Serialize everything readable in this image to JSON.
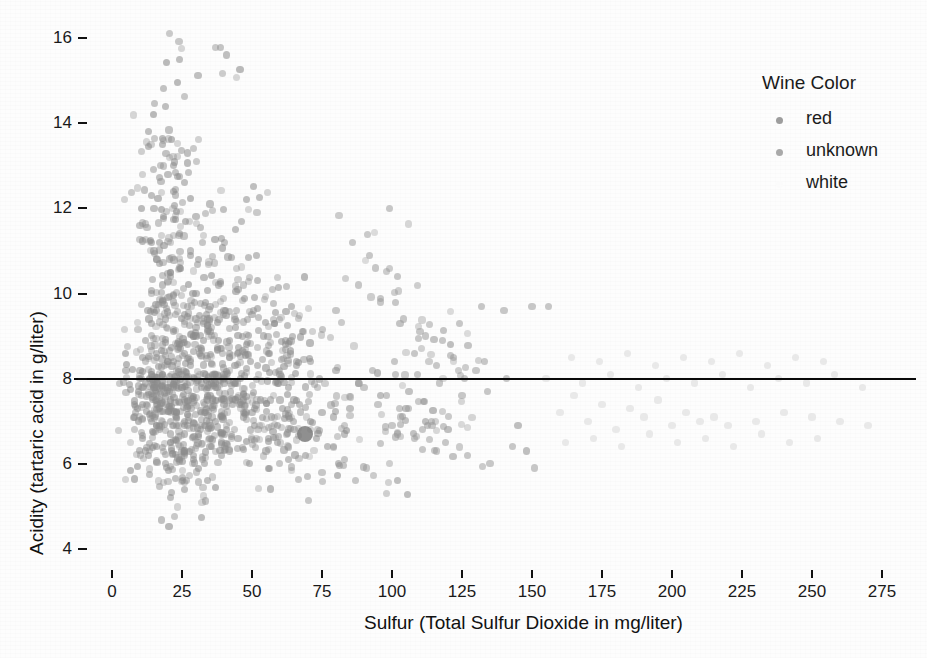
{
  "chart_data": {
    "type": "scatter",
    "title": "",
    "xlabel": "Sulfur (Total Sulfur Dioxide  in mg/liter)",
    "ylabel": "Acidity (tartaric acid in g/liter)",
    "xlim": [
      -4,
      287
    ],
    "ylim": [
      3.4,
      16.4
    ],
    "xticks": [
      0,
      25,
      50,
      75,
      100,
      125,
      150,
      175,
      200,
      225,
      250,
      275
    ],
    "xtick_labels": [
      "0",
      "25",
      "50",
      "75",
      "100",
      "125",
      "150",
      "175",
      "200",
      "225",
      "250",
      "275"
    ],
    "yticks": [
      4,
      6,
      8,
      10,
      12,
      14,
      16
    ],
    "ytick_labels": [
      "4",
      "6",
      "8",
      "10",
      "12",
      "14",
      "16"
    ],
    "grid": false,
    "legend_position": "right",
    "point_color": "#8c8c8c",
    "point_opacity": 0.55,
    "point_radius": 3.6,
    "reference_line": {
      "orientation": "horizontal",
      "y": 8,
      "color": "#0a0a0a",
      "width": 2,
      "x_start": 0,
      "x_end": 287
    },
    "highlight_point": {
      "x": 69,
      "y": 6.7,
      "radius": 8,
      "color": "#7b7b7b"
    },
    "series": [
      {
        "name": "red",
        "color": "#8c8c8c",
        "points": [
          [
            11,
            7.4
          ],
          [
            25,
            7.8
          ],
          [
            15,
            7.8
          ],
          [
            17,
            11.2
          ],
          [
            40,
            7.4
          ],
          [
            59,
            7.9
          ],
          [
            21,
            7.3
          ],
          [
            18,
            7.8
          ],
          [
            102,
            6.7
          ],
          [
            65,
            7.5
          ],
          [
            102,
            5.6
          ],
          [
            37,
            7.8
          ],
          [
            121,
            8.8
          ],
          [
            40,
            7.5
          ],
          [
            59,
            6.9
          ],
          [
            21,
            7.9
          ],
          [
            18,
            8.1
          ],
          [
            47,
            7.5
          ],
          [
            145,
            6.9
          ],
          [
            148,
            6.3
          ],
          [
            63,
            7.8
          ],
          [
            44,
            7.5
          ],
          [
            33,
            6.9
          ],
          [
            34,
            7.8
          ],
          [
            40,
            8.1
          ],
          [
            37,
            7.9
          ],
          [
            42,
            7.5
          ],
          [
            16,
            6.9
          ],
          [
            15,
            7.8
          ],
          [
            18,
            8.1
          ],
          [
            8,
            7.4
          ],
          [
            16,
            7.8
          ],
          [
            23,
            7.8
          ],
          [
            14,
            11.2
          ],
          [
            16,
            7.4
          ],
          [
            40,
            7.9
          ],
          [
            51,
            7.3
          ],
          [
            20,
            7.8
          ],
          [
            26,
            6.7
          ],
          [
            34,
            7.5
          ],
          [
            34,
            5.6
          ],
          [
            19,
            7.8
          ],
          [
            27,
            8.8
          ],
          [
            26,
            7.5
          ],
          [
            23,
            6.9
          ],
          [
            12,
            7.9
          ],
          [
            14,
            8.1
          ],
          [
            16,
            7.5
          ],
          [
            16,
            6.9
          ],
          [
            12,
            6.3
          ],
          [
            22,
            7.8
          ],
          [
            21,
            7.5
          ],
          [
            26,
            6.9
          ],
          [
            25,
            7.8
          ],
          [
            25,
            8.1
          ],
          [
            16,
            7.9
          ],
          [
            17,
            7.5
          ],
          [
            35,
            6.9
          ],
          [
            32,
            7.8
          ],
          [
            37,
            8.1
          ],
          [
            11,
            8.5
          ],
          [
            16,
            8.5
          ],
          [
            24,
            8.1
          ],
          [
            32,
            7.9
          ],
          [
            30,
            9.2
          ],
          [
            21,
            5.2
          ],
          [
            36,
            7.5
          ],
          [
            8,
            7.1
          ],
          [
            26,
            6.2
          ],
          [
            20,
            9.9
          ],
          [
            44,
            7.9
          ],
          [
            23,
            7.2
          ],
          [
            35,
            6.6
          ],
          [
            42,
            6.3
          ],
          [
            26,
            5.4
          ],
          [
            21,
            6.7
          ],
          [
            34,
            7.6
          ],
          [
            42,
            8.6
          ],
          [
            30,
            9.4
          ],
          [
            28,
            8.4
          ],
          [
            38,
            10.2
          ],
          [
            42,
            8.9
          ],
          [
            35,
            9.1
          ],
          [
            50,
            7.2
          ],
          [
            60,
            7.5
          ],
          [
            56,
            6.6
          ],
          [
            66,
            8.3
          ],
          [
            47,
            7.1
          ],
          [
            29,
            6.2
          ],
          [
            26,
            7.0
          ],
          [
            33,
            6.0
          ],
          [
            24,
            6.1
          ],
          [
            10,
            11.6
          ],
          [
            28,
            11.0
          ],
          [
            21,
            10.4
          ],
          [
            31,
            10.8
          ],
          [
            20,
            12.8
          ],
          [
            24,
            11.4
          ],
          [
            18,
            10.2
          ],
          [
            22,
            9.8
          ],
          [
            15,
            12.0
          ],
          [
            29,
            9.0
          ],
          [
            26,
            8.6
          ],
          [
            34,
            9.1
          ],
          [
            40,
            8.0
          ],
          [
            16,
            9.6
          ],
          [
            19,
            9.4
          ],
          [
            24,
            10.6
          ],
          [
            30,
            10.0
          ],
          [
            35,
            9.7
          ],
          [
            13,
            13.8
          ],
          [
            19,
            14.4
          ],
          [
            24,
            15.5
          ],
          [
            41,
            15.6
          ],
          [
            27,
            13.3
          ],
          [
            18,
            13.5
          ],
          [
            22,
            12.4
          ],
          [
            35,
            12.1
          ],
          [
            48,
            12.2
          ],
          [
            14,
            12.3
          ],
          [
            22,
            13.0
          ],
          [
            26,
            12.6
          ],
          [
            30,
            11.8
          ],
          [
            44,
            11.5
          ],
          [
            52,
            10.3
          ],
          [
            15,
            11.0
          ],
          [
            17,
            10.7
          ],
          [
            28,
            10.9
          ],
          [
            39,
            11.3
          ],
          [
            45,
            10.1
          ],
          [
            51,
            9.9
          ],
          [
            58,
            9.3
          ],
          [
            62,
            8.8
          ],
          [
            71,
            8.4
          ],
          [
            80,
            8.2
          ],
          [
            88,
            7.9
          ],
          [
            96,
            7.6
          ],
          [
            105,
            7.3
          ],
          [
            112,
            7.0
          ],
          [
            120,
            6.8
          ],
          [
            9,
            7.3
          ],
          [
            11,
            6.6
          ],
          [
            13,
            6.2
          ],
          [
            14,
            7.0
          ],
          [
            16,
            6.4
          ],
          [
            17,
            6.8
          ],
          [
            19,
            6.0
          ],
          [
            21,
            6.5
          ],
          [
            23,
            7.1
          ],
          [
            25,
            6.3
          ],
          [
            27,
            6.9
          ],
          [
            29,
            6.1
          ],
          [
            31,
            6.7
          ],
          [
            33,
            7.2
          ],
          [
            35,
            6.4
          ],
          [
            37,
            7.0
          ],
          [
            39,
            6.2
          ],
          [
            41,
            6.8
          ],
          [
            43,
            7.4
          ],
          [
            45,
            6.6
          ],
          [
            47,
            7.2
          ],
          [
            49,
            6.0
          ],
          [
            51,
            6.9
          ],
          [
            53,
            7.5
          ],
          [
            55,
            6.3
          ],
          [
            57,
            7.1
          ],
          [
            59,
            6.5
          ],
          [
            61,
            7.3
          ],
          [
            63,
            6.1
          ],
          [
            65,
            6.8
          ],
          [
            67,
            7.4
          ],
          [
            69,
            6.2
          ],
          [
            71,
            7.0
          ],
          [
            73,
            6.6
          ],
          [
            75,
            7.2
          ],
          [
            77,
            6.4
          ],
          [
            79,
            7.1
          ],
          [
            81,
            6.0
          ],
          [
            83,
            6.7
          ],
          [
            85,
            7.3
          ],
          [
            10,
            8.2
          ],
          [
            12,
            8.9
          ],
          [
            14,
            9.3
          ],
          [
            16,
            8.6
          ],
          [
            18,
            9.8
          ],
          [
            20,
            8.4
          ],
          [
            22,
            9.1
          ],
          [
            24,
            8.8
          ],
          [
            26,
            9.5
          ],
          [
            28,
            8.3
          ],
          [
            30,
            9.0
          ],
          [
            32,
            8.7
          ],
          [
            34,
            9.4
          ],
          [
            36,
            8.1
          ],
          [
            38,
            8.9
          ],
          [
            40,
            9.6
          ],
          [
            42,
            8.5
          ],
          [
            44,
            9.2
          ],
          [
            46,
            8.0
          ],
          [
            48,
            8.8
          ],
          [
            50,
            9.5
          ],
          [
            52,
            8.3
          ],
          [
            54,
            9.0
          ],
          [
            56,
            8.6
          ],
          [
            58,
            9.3
          ],
          [
            60,
            8.1
          ],
          [
            62,
            8.9
          ],
          [
            64,
            9.7
          ],
          [
            66,
            8.4
          ],
          [
            68,
            9.1
          ]
        ]
      },
      {
        "name": "unknown",
        "color": "#9a9a9a",
        "points": [
          [
            96,
            9.8
          ],
          [
            104,
            9.4
          ],
          [
            112,
            9.0
          ],
          [
            88,
            10.2
          ],
          [
            80,
            9.6
          ],
          [
            124,
            9.3
          ],
          [
            132,
            9.7
          ],
          [
            140,
            9.6
          ],
          [
            150,
            9.7
          ],
          [
            156,
            9.7
          ],
          [
            108,
            8.6
          ],
          [
            116,
            8.3
          ],
          [
            126,
            8.0
          ],
          [
            134,
            7.7
          ],
          [
            99,
            12.0
          ],
          [
            92,
            10.9
          ],
          [
            86,
            11.2
          ],
          [
            118,
            8.9
          ],
          [
            122,
            8.5
          ],
          [
            130,
            8.2
          ],
          [
            95,
            7.4
          ],
          [
            103,
            7.1
          ],
          [
            111,
            6.8
          ],
          [
            119,
            6.5
          ],
          [
            127,
            6.2
          ],
          [
            135,
            6.0
          ],
          [
            143,
            6.4
          ],
          [
            151,
            5.9
          ],
          [
            90,
            7.8
          ],
          [
            98,
            7.6
          ],
          [
            106,
            7.3
          ],
          [
            114,
            7.0
          ],
          [
            100,
            6.9
          ],
          [
            108,
            6.6
          ],
          [
            116,
            6.3
          ],
          [
            91,
            5.9
          ],
          [
            83,
            6.1
          ],
          [
            87,
            5.6
          ],
          [
            79,
            6.4
          ],
          [
            75,
            5.8
          ],
          [
            93,
            8.2
          ],
          [
            101,
            8.4
          ],
          [
            109,
            8.1
          ],
          [
            117,
            7.9
          ],
          [
            125,
            7.6
          ],
          [
            133,
            8.4
          ],
          [
            141,
            8.0
          ],
          [
            102,
            10.4
          ],
          [
            94,
            10.6
          ],
          [
            110,
            9.1
          ]
        ]
      },
      {
        "name": "white",
        "color": "#d8d8d8",
        "points": [
          [
            160,
            7.2
          ],
          [
            170,
            7.0
          ],
          [
            180,
            6.8
          ],
          [
            190,
            7.1
          ],
          [
            200,
            6.9
          ],
          [
            210,
            7.0
          ],
          [
            165,
            7.6
          ],
          [
            175,
            7.4
          ],
          [
            185,
            7.3
          ],
          [
            195,
            7.5
          ],
          [
            205,
            7.2
          ],
          [
            215,
            7.1
          ],
          [
            220,
            6.9
          ],
          [
            230,
            7.0
          ],
          [
            240,
            7.2
          ],
          [
            250,
            7.1
          ],
          [
            260,
            7.0
          ],
          [
            270,
            6.9
          ],
          [
            155,
            8.0
          ],
          [
            168,
            7.9
          ],
          [
            178,
            8.1
          ],
          [
            188,
            7.8
          ],
          [
            198,
            8.0
          ],
          [
            208,
            7.9
          ],
          [
            218,
            8.1
          ],
          [
            228,
            7.8
          ],
          [
            238,
            8.0
          ],
          [
            248,
            7.9
          ],
          [
            258,
            8.1
          ],
          [
            268,
            7.8
          ],
          [
            162,
            6.5
          ],
          [
            172,
            6.6
          ],
          [
            182,
            6.4
          ],
          [
            192,
            6.7
          ],
          [
            202,
            6.5
          ],
          [
            212,
            6.6
          ],
          [
            222,
            6.4
          ],
          [
            232,
            6.7
          ],
          [
            242,
            6.5
          ],
          [
            252,
            6.6
          ],
          [
            164,
            8.5
          ],
          [
            174,
            8.4
          ],
          [
            184,
            8.6
          ],
          [
            194,
            8.3
          ],
          [
            204,
            8.5
          ],
          [
            214,
            8.4
          ],
          [
            224,
            8.6
          ],
          [
            234,
            8.3
          ],
          [
            244,
            8.5
          ],
          [
            254,
            8.4
          ]
        ]
      }
    ]
  },
  "legend": {
    "title": "Wine Color",
    "entries": [
      {
        "label": "red",
        "color": "#9d9d9d"
      },
      {
        "label": "unknown",
        "color": "#a9a9a9"
      },
      {
        "label": "white",
        "color": "#fbfbfb"
      }
    ]
  }
}
